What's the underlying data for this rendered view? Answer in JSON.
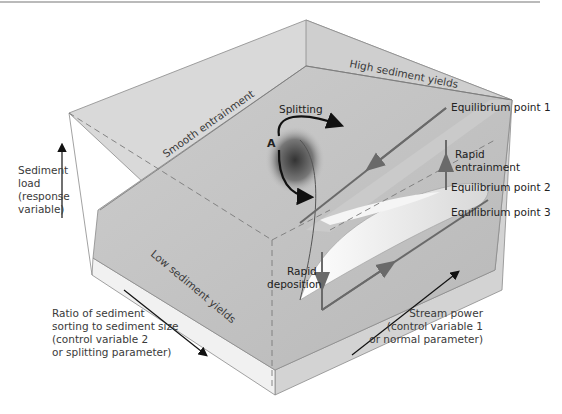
{
  "figure": {
    "colors": {
      "box_face": "#d6d6d6",
      "box_top": "#cfcfcf",
      "surface": "#c4c4c4",
      "fold_highlight": "#f2f2f2",
      "path": "#5a5a5a",
      "edge": "#8a8a8a",
      "black_arrow": "#111111"
    },
    "surface_labels": {
      "smooth": "Smooth entrainment",
      "high": "High sediment yields",
      "low": "Low sediment yields",
      "splitting": "Splitting",
      "point_a": "A"
    },
    "equilibrium": {
      "p1": "Equilibrium point 1",
      "p2": "Equilibrium point 2",
      "p3": "Equilibrium point 3"
    },
    "transitions": {
      "entrainment": [
        "Rapid",
        "entrainment"
      ],
      "deposition": [
        "Rapid",
        "deposition"
      ]
    },
    "axes": {
      "y": [
        "Sediment",
        "load",
        "(response",
        "variable)"
      ],
      "splitting": [
        "Ratio of sediment",
        "sorting to sediment size",
        "(control variable 2",
        "or splitting parameter)"
      ],
      "normal": [
        "Stream power",
        "(control variable 1",
        "or normal parameter)"
      ]
    }
  }
}
